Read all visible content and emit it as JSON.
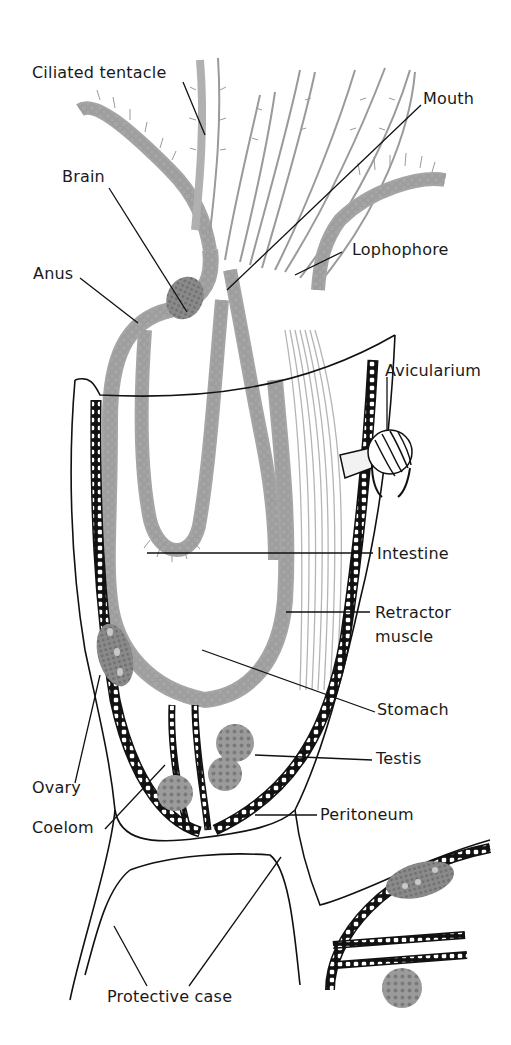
{
  "diagram": {
    "colors": {
      "outline": "#111111",
      "tissue_gray": "#9a9a9a",
      "organ_gray": "#6e6e6e",
      "background": "#ffffff"
    },
    "labels": {
      "ciliated_tentacle": "Ciliated tentacle",
      "mouth": "Mouth",
      "brain": "Brain",
      "lophophore": "Lophophore",
      "anus": "Anus",
      "avicularium": "Avicularium",
      "intestine": "Intestine",
      "retractor_muscle_line1": "Retractor",
      "retractor_muscle_line2": "muscle",
      "stomach": "Stomach",
      "testis": "Testis",
      "ovary": "Ovary",
      "coelom": "Coelom",
      "peritoneum": "Peritoneum",
      "protective_case": "Protective case"
    }
  }
}
